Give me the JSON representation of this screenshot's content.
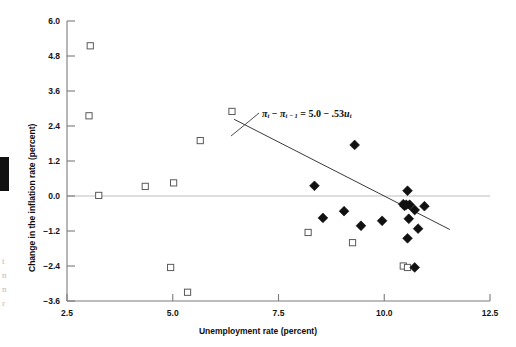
{
  "figure": {
    "title": "",
    "equation_parts": {
      "pi_symbol": "π",
      "sub_t": "t",
      "sub_t_minus_1": "t − 1",
      "minus": "−",
      "equals": "=",
      "intercept": "5.0",
      "slope_term": ".53",
      "u_symbol": "u",
      "full_text": "πt − πt−1 = 5.0 − .53ut"
    },
    "edge_fragments": [
      "t",
      "n",
      "n",
      "r"
    ]
  },
  "chart_data": {
    "type": "scatter",
    "title": "",
    "xlabel": "Unemployment rate (percent)",
    "ylabel": "Change in the inflation rate (percent)",
    "xlim": [
      2.5,
      12.5
    ],
    "ylim": [
      -3.6,
      6.0
    ],
    "xticks": [
      2.5,
      5.0,
      7.5,
      10.0,
      12.5
    ],
    "xticklabels": [
      "2.5",
      "5.0",
      "7.5",
      "10.0",
      "12.5"
    ],
    "yticks": [
      6.0,
      4.8,
      3.6,
      2.4,
      1.2,
      0.0,
      -1.2,
      -2.4,
      -3.6
    ],
    "yticklabels": [
      "6.0",
      "4.8",
      "3.6",
      "2.4",
      "1.2",
      "0.0",
      "−1.2",
      "−2.4",
      "−3.6"
    ],
    "grid": false,
    "zero_line": true,
    "legend": null,
    "marker_colors": {
      "open_square_edge": "#5a5a5a",
      "filled_diamond": "#111111",
      "regression_line": "#3a3a3a",
      "axis": "#7b7b7b",
      "zero_line": "#bdbdbd"
    },
    "series": [
      {
        "name": "open-square",
        "marker": "open-square",
        "points": [
          [
            3.05,
            5.15
          ],
          [
            3.02,
            2.75
          ],
          [
            3.25,
            0.02
          ],
          [
            4.35,
            0.33
          ],
          [
            4.95,
            -2.45
          ],
          [
            5.02,
            0.45
          ],
          [
            5.35,
            -3.3
          ],
          [
            5.65,
            1.9
          ],
          [
            6.4,
            2.9
          ],
          [
            8.2,
            -1.25
          ],
          [
            9.25,
            -1.6
          ],
          [
            10.45,
            -2.4
          ],
          [
            10.55,
            -2.45
          ]
        ]
      },
      {
        "name": "filled-diamond",
        "marker": "filled-diamond",
        "points": [
          [
            9.3,
            1.75
          ],
          [
            8.35,
            0.35
          ],
          [
            8.55,
            -0.75
          ],
          [
            9.05,
            -0.52
          ],
          [
            9.45,
            -1.02
          ],
          [
            9.95,
            -0.85
          ],
          [
            10.55,
            0.18
          ],
          [
            10.45,
            -0.28
          ],
          [
            10.52,
            -0.3
          ],
          [
            10.6,
            -0.3
          ],
          [
            10.72,
            -0.48
          ],
          [
            10.95,
            -0.35
          ],
          [
            10.58,
            -0.78
          ],
          [
            10.8,
            -1.12
          ],
          [
            10.55,
            -1.45
          ],
          [
            10.72,
            -2.45
          ],
          [
            10.48,
            -0.34
          ]
        ]
      }
    ],
    "regression_line": {
      "equation": "πt − πt−1 = 5.0 − .53ut",
      "intercept": 5.0,
      "slope": -0.53,
      "x_start": 6.45,
      "x_end": 11.55,
      "y_start": 2.63,
      "y_end": -1.15
    }
  }
}
